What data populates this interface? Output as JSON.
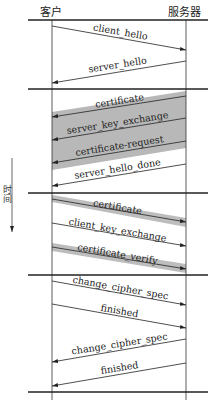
{
  "diagram": {
    "participants": {
      "client": "客户",
      "server": "服务器"
    },
    "time_label": "时间",
    "colors": {
      "line": "#222222",
      "band": "#b8b8b8"
    },
    "messages": [
      {
        "label": "client_hello",
        "direction": "client->server",
        "shaded": false,
        "phase": 1
      },
      {
        "label": "server_hello",
        "direction": "server->client",
        "shaded": false,
        "phase": 1
      },
      {
        "label": "certificate",
        "direction": "server->client",
        "shaded": true,
        "phase": 2
      },
      {
        "label": "server_key_exchange",
        "direction": "server->client",
        "shaded": true,
        "phase": 2
      },
      {
        "label": "certificate-request",
        "direction": "server->client",
        "shaded": true,
        "phase": 2
      },
      {
        "label": "server_hello_done",
        "direction": "server->client",
        "shaded": false,
        "phase": 2
      },
      {
        "label": "certificate",
        "direction": "client->server",
        "shaded": true,
        "phase": 3
      },
      {
        "label": "client_key_exchange",
        "direction": "client->server",
        "shaded": false,
        "phase": 3
      },
      {
        "label": "certificate_verify",
        "direction": "client->server",
        "shaded": true,
        "phase": 3
      },
      {
        "label": "change_cipher_spec",
        "direction": "client->server",
        "shaded": false,
        "phase": 4
      },
      {
        "label": "finished",
        "direction": "client->server",
        "shaded": false,
        "phase": 4
      },
      {
        "label": "change_cipher_spec",
        "direction": "server->client",
        "shaded": false,
        "phase": 4
      },
      {
        "label": "finished",
        "direction": "server->client",
        "shaded": false,
        "phase": 4
      }
    ]
  }
}
